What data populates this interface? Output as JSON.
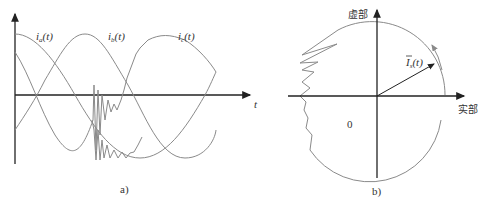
{
  "figure": {
    "panel_a": {
      "caption": "a)",
      "x_axis_label": "t",
      "curves": [
        {
          "name": "i_a(t)",
          "label_main": "i",
          "label_sub": "a",
          "label_tail": "(t)"
        },
        {
          "name": "i_b(t)",
          "label_main": "i",
          "label_sub": "b",
          "label_tail": "(t)"
        },
        {
          "name": "i_c(t)",
          "label_main": "i",
          "label_sub": "c",
          "label_tail": "(t)"
        }
      ]
    },
    "panel_b": {
      "caption": "b)",
      "imag_axis_label": "虚部",
      "real_axis_label": "实部",
      "origin_label": "0",
      "vector_label_main": "I",
      "vector_label_sub": "s",
      "vector_label_tail": "(t)"
    }
  },
  "colors": {
    "axis": "#222222",
    "curve": "#8a8a8a",
    "text": "#333333"
  }
}
